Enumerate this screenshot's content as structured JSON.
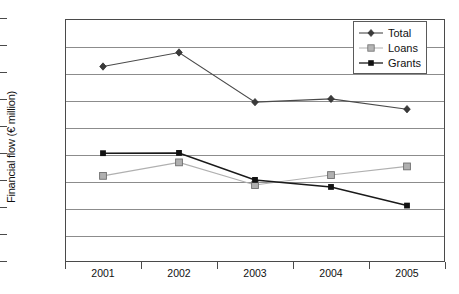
{
  "chart_data": {
    "type": "line",
    "title": "",
    "xlabel": "",
    "ylabel": "Financial flow (€ million)",
    "categories": [
      "2001",
      "2002",
      "2003",
      "2004",
      "2005"
    ],
    "x": [
      2001,
      2002,
      2003,
      2004,
      2005
    ],
    "series": [
      {
        "name": "Total",
        "values": [
          3620,
          3880,
          2960,
          3020,
          2830
        ],
        "color": "#4a4a4a",
        "marker": "diamond"
      },
      {
        "name": "Loans",
        "values": [
          1595,
          1845,
          1425,
          1610,
          1770
        ],
        "color": "#b0b0b0",
        "marker": "square"
      },
      {
        "name": "Grants",
        "values": [
          2015,
          2020,
          1520,
          1390,
          1045
        ],
        "color": "#1a1a1a",
        "marker": "triangle"
      }
    ],
    "ylim": [
      0,
      4500
    ],
    "ytick_values": [
      0,
      500,
      1000,
      1500,
      2000,
      2500,
      3000,
      3500,
      4000,
      4500
    ],
    "ytick_labels": [
      "0",
      "500",
      "1,000",
      "1,500",
      "2,000",
      "2,500",
      "3,000",
      "3,500",
      "4,000",
      "4,500"
    ],
    "grid": true,
    "legend_position": "top-right",
    "legend_entries": [
      "Total",
      "Loans",
      "Grants"
    ]
  },
  "legend": {
    "items": [
      {
        "label": "Total"
      },
      {
        "label": "Loans"
      },
      {
        "label": "Grants"
      }
    ]
  },
  "colors": {
    "total": "#4a4a4a",
    "loans": "#b0b0b0",
    "grants": "#1a1a1a",
    "gridline": "#8c8c8c",
    "axis": "#4a4a4a",
    "background": "#ffffff"
  }
}
